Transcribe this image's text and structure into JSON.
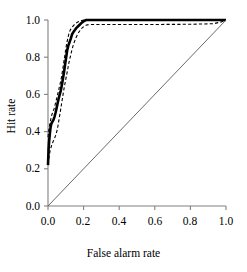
{
  "chart_data": {
    "type": "line",
    "title": "",
    "subtitle": "",
    "xlabel": "False alarm rate",
    "ylabel": "Hit rate",
    "xlim": [
      0.0,
      1.0
    ],
    "ylim": [
      0.0,
      1.0
    ],
    "grid": false,
    "legend": "none",
    "xticks": [
      "0.0",
      "0.2",
      "0.4",
      "0.6",
      "0.8",
      "1.0"
    ],
    "xtick_values": [
      0.0,
      0.2,
      0.4,
      0.6,
      0.8,
      1.0
    ],
    "yticks": [
      "0.0",
      "0.2",
      "0.4",
      "0.6",
      "0.8",
      "1.0"
    ],
    "ytick_values": [
      0.0,
      0.2,
      0.4,
      0.6,
      0.8,
      1.0
    ],
    "colors": {
      "curve": "#000000",
      "confidence_band": "#000000",
      "chance_line": "#595959",
      "axis": "#808080",
      "background": "#ffffff"
    },
    "series": [
      {
        "name": "ROC curve",
        "style": "solid",
        "width": 2.6,
        "color": "#000000",
        "points": [
          [
            0.0,
            0.22
          ],
          [
            0.003,
            0.3
          ],
          [
            0.006,
            0.345
          ],
          [
            0.01,
            0.385
          ],
          [
            0.014,
            0.42
          ],
          [
            0.018,
            0.44
          ],
          [
            0.024,
            0.452
          ],
          [
            0.03,
            0.462
          ],
          [
            0.036,
            0.478
          ],
          [
            0.042,
            0.5
          ],
          [
            0.048,
            0.525
          ],
          [
            0.054,
            0.552
          ],
          [
            0.06,
            0.578
          ],
          [
            0.066,
            0.6
          ],
          [
            0.072,
            0.622
          ],
          [
            0.078,
            0.65
          ],
          [
            0.084,
            0.685
          ],
          [
            0.09,
            0.72
          ],
          [
            0.096,
            0.76
          ],
          [
            0.102,
            0.8
          ],
          [
            0.108,
            0.838
          ],
          [
            0.114,
            0.862
          ],
          [
            0.12,
            0.878
          ],
          [
            0.128,
            0.9
          ],
          [
            0.136,
            0.925
          ],
          [
            0.146,
            0.94
          ],
          [
            0.16,
            0.958
          ],
          [
            0.175,
            0.972
          ],
          [
            0.19,
            0.986
          ],
          [
            0.205,
            0.996
          ],
          [
            0.215,
            1.0
          ],
          [
            1.0,
            1.0
          ]
        ]
      },
      {
        "name": "Upper confidence band",
        "style": "dashed",
        "width": 1.1,
        "color": "#000000",
        "points": [
          [
            0.0,
            0.37
          ],
          [
            0.004,
            0.405
          ],
          [
            0.01,
            0.44
          ],
          [
            0.016,
            0.468
          ],
          [
            0.022,
            0.492
          ],
          [
            0.028,
            0.508
          ],
          [
            0.034,
            0.522
          ],
          [
            0.04,
            0.545
          ],
          [
            0.046,
            0.568
          ],
          [
            0.052,
            0.592
          ],
          [
            0.058,
            0.615
          ],
          [
            0.064,
            0.64
          ],
          [
            0.07,
            0.665
          ],
          [
            0.076,
            0.695
          ],
          [
            0.082,
            0.73
          ],
          [
            0.088,
            0.768
          ],
          [
            0.094,
            0.805
          ],
          [
            0.1,
            0.845
          ],
          [
            0.106,
            0.878
          ],
          [
            0.112,
            0.905
          ],
          [
            0.118,
            0.928
          ],
          [
            0.126,
            0.948
          ],
          [
            0.136,
            0.962
          ],
          [
            0.148,
            0.975
          ],
          [
            0.162,
            0.986
          ],
          [
            0.178,
            0.994
          ],
          [
            0.196,
            0.999
          ],
          [
            0.21,
            1.0
          ],
          [
            1.0,
            1.0
          ]
        ]
      },
      {
        "name": "Lower confidence band",
        "style": "dashed",
        "width": 1.1,
        "color": "#000000",
        "points": [
          [
            0.0,
            0.225
          ],
          [
            0.006,
            0.265
          ],
          [
            0.012,
            0.298
          ],
          [
            0.02,
            0.325
          ],
          [
            0.028,
            0.345
          ],
          [
            0.036,
            0.362
          ],
          [
            0.044,
            0.382
          ],
          [
            0.052,
            0.41
          ],
          [
            0.058,
            0.442
          ],
          [
            0.064,
            0.478
          ],
          [
            0.07,
            0.512
          ],
          [
            0.076,
            0.548
          ],
          [
            0.082,
            0.585
          ],
          [
            0.088,
            0.62
          ],
          [
            0.094,
            0.652
          ],
          [
            0.1,
            0.682
          ],
          [
            0.106,
            0.712
          ],
          [
            0.112,
            0.742
          ],
          [
            0.118,
            0.772
          ],
          [
            0.126,
            0.805
          ],
          [
            0.134,
            0.838
          ],
          [
            0.144,
            0.872
          ],
          [
            0.156,
            0.902
          ],
          [
            0.17,
            0.93
          ],
          [
            0.186,
            0.952
          ],
          [
            0.202,
            0.966
          ],
          [
            0.22,
            0.974
          ],
          [
            0.25,
            0.976
          ],
          [
            0.4,
            0.976
          ],
          [
            0.6,
            0.976
          ],
          [
            0.8,
            0.977
          ],
          [
            0.93,
            0.98
          ],
          [
            0.975,
            0.99
          ],
          [
            1.0,
            1.0
          ]
        ]
      },
      {
        "name": "Chance line",
        "style": "solid",
        "width": 0.9,
        "color": "#595959",
        "points": [
          [
            0.0,
            0.0
          ],
          [
            1.0,
            1.0
          ]
        ]
      }
    ]
  }
}
